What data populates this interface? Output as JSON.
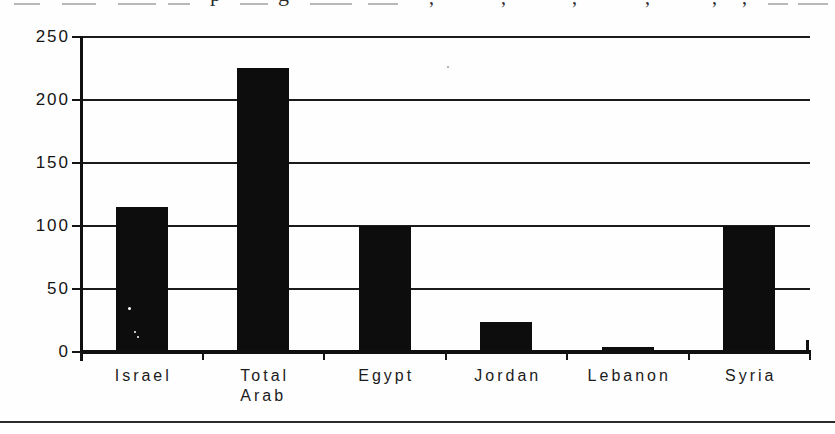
{
  "page": {
    "background": "#fefefe",
    "bottom_rule_color": "#2b2b2b",
    "clipped_caption_fragments": [
      {
        "kind": "smudge",
        "x": 14,
        "w": 26
      },
      {
        "kind": "smudge",
        "x": 62,
        "w": 34
      },
      {
        "kind": "smudge",
        "x": 118,
        "w": 38
      },
      {
        "kind": "smudge",
        "x": 168,
        "w": 22
      },
      {
        "kind": "letter",
        "ch": "p",
        "x": 210
      },
      {
        "kind": "smudge",
        "x": 240,
        "w": 28
      },
      {
        "kind": "letter",
        "ch": "g",
        "x": 278
      },
      {
        "kind": "smudge",
        "x": 310,
        "w": 42
      },
      {
        "kind": "smudge",
        "x": 368,
        "w": 30
      },
      {
        "kind": "comma",
        "ch": ",",
        "x": 429
      },
      {
        "kind": "comma",
        "ch": ",",
        "x": 501
      },
      {
        "kind": "comma",
        "ch": ",",
        "x": 572
      },
      {
        "kind": "comma",
        "ch": ",",
        "x": 645
      },
      {
        "kind": "comma",
        "ch": ",",
        "x": 712
      },
      {
        "kind": "comma",
        "ch": ",",
        "x": 742
      },
      {
        "kind": "smudge",
        "x": 768,
        "w": 20
      },
      {
        "kind": "smudge",
        "x": 798,
        "w": 30
      }
    ]
  },
  "chart_data": {
    "type": "bar",
    "title": "",
    "categories": [
      "Israel",
      "Total Arab",
      "Egypt",
      "Jordan",
      "Lebanon",
      "Syria"
    ],
    "category_label_lines": [
      [
        "Israel"
      ],
      [
        "Total",
        "Arab"
      ],
      [
        "Egypt"
      ],
      [
        "Jordan"
      ],
      [
        "Lebanon"
      ],
      [
        "Syria"
      ]
    ],
    "values": [
      115,
      225,
      100,
      24,
      4,
      100
    ],
    "xlabel": "",
    "ylabel": "",
    "ylim": [
      0,
      250
    ],
    "yticks": [
      0,
      50,
      100,
      150,
      200,
      250
    ],
    "grid": "horizontal",
    "legend": "none",
    "bar_color": "#0d0d0d",
    "axis_color": "#101010",
    "gridline_color": "#1b1b1b"
  },
  "scan_artifacts": {
    "specks": [
      {
        "x": 128,
        "y": 307,
        "r": 3,
        "color": "#ffffff"
      },
      {
        "x": 134,
        "y": 331,
        "r": 2,
        "color": "#ffffff"
      },
      {
        "x": 137,
        "y": 336,
        "r": 2,
        "color": "#ffffff"
      },
      {
        "x": 447,
        "y": 66,
        "r": 2,
        "color": "#9a9a9a"
      }
    ]
  }
}
